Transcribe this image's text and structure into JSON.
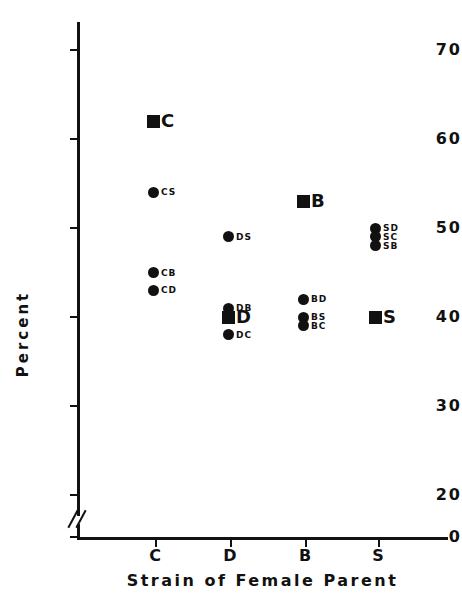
{
  "chart_data": {
    "type": "scatter",
    "title": "",
    "xlabel": "Strain of Female Parent",
    "ylabel": "Percent",
    "x_categories": [
      "C",
      "D",
      "B",
      "S"
    ],
    "ytick_labels": [
      "70",
      "60",
      "50",
      "40",
      "30",
      "20",
      "0"
    ],
    "ytick_values": [
      70,
      60,
      50,
      40,
      30,
      20,
      0
    ],
    "ylim": [
      20,
      73
    ],
    "axis_break": "between 20 and 0",
    "grid": false,
    "legend": "none",
    "marker_types": {
      "square": "parental strain mean",
      "circle": "cross / hybrid"
    },
    "points": [
      {
        "label": "C",
        "x_category": "C",
        "value": 62,
        "marker": "square",
        "label_size": "big"
      },
      {
        "label": "CS",
        "x_category": "C",
        "value": 54,
        "marker": "circle",
        "label_size": "small"
      },
      {
        "label": "CB",
        "x_category": "C",
        "value": 45,
        "marker": "circle",
        "label_size": "small"
      },
      {
        "label": "CD",
        "x_category": "C",
        "value": 43,
        "marker": "circle",
        "label_size": "small"
      },
      {
        "label": "DS",
        "x_category": "D",
        "value": 49,
        "marker": "circle",
        "label_size": "small"
      },
      {
        "label": "DB",
        "x_category": "D",
        "value": 41,
        "marker": "circle",
        "label_size": "small"
      },
      {
        "label": "D",
        "x_category": "D",
        "value": 40,
        "marker": "square",
        "label_size": "big"
      },
      {
        "label": "DC",
        "x_category": "D",
        "value": 38,
        "marker": "circle",
        "label_size": "small"
      },
      {
        "label": "B",
        "x_category": "B",
        "value": 53,
        "marker": "square",
        "label_size": "big"
      },
      {
        "label": "BD",
        "x_category": "B",
        "value": 42,
        "marker": "circle",
        "label_size": "small"
      },
      {
        "label": "BS",
        "x_category": "B",
        "value": 40,
        "marker": "circle",
        "label_size": "small"
      },
      {
        "label": "BC",
        "x_category": "B",
        "value": 39,
        "marker": "circle",
        "label_size": "small"
      },
      {
        "label": "SD",
        "x_category": "S",
        "value": 50,
        "marker": "circle",
        "label_size": "small"
      },
      {
        "label": "SC",
        "x_category": "S",
        "value": 49,
        "marker": "circle",
        "label_size": "small"
      },
      {
        "label": "SB",
        "x_category": "S",
        "value": 48,
        "marker": "circle",
        "label_size": "small"
      },
      {
        "label": "S",
        "x_category": "S",
        "value": 40,
        "marker": "square",
        "label_size": "big"
      }
    ],
    "colors": {
      "marker": "#111111",
      "axis": "#111111",
      "background": "#ffffff"
    }
  },
  "layout": {
    "y_pixel_at_50": 228,
    "y_pixels_per_unit": 8.9,
    "x_positions": {
      "C": 155,
      "D": 230,
      "B": 305,
      "S": 378
    },
    "marker_x_offsets": {
      "C": -2,
      "D": -2,
      "B": -2,
      "S": -3
    }
  }
}
